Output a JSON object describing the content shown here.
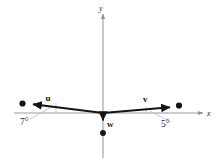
{
  "figure": {
    "background_color": "#ffffff",
    "axis_color": "#9b9b9b",
    "vector_color": "#141414",
    "point_color": "#141414",
    "guide_color": "#b5b5b5"
  },
  "axes": {
    "x_label": "x",
    "y_label": "y",
    "origin": {
      "x": 103,
      "y": 113
    },
    "x_start": {
      "x": 14,
      "y": 113
    },
    "x_end": {
      "x": 203,
      "y": 113
    },
    "y_start": {
      "x": 103,
      "y": 12
    },
    "y_end": {
      "x": 103,
      "y": 158
    }
  },
  "vectors": [
    {
      "name": "u",
      "label": "u",
      "angle_deg": 7,
      "angle_label": "7°",
      "direction": "left-up",
      "tail": {
        "x": 103,
        "y": 113
      },
      "tip": {
        "x": 31,
        "y": 104
      },
      "endpoint_dot": {
        "x": 23,
        "y": 103
      },
      "label_pos": {
        "x": 49,
        "y": 101
      },
      "angle_label_pos": {
        "x": 22,
        "y": 124
      }
    },
    {
      "name": "v",
      "label": "v",
      "angle_deg": 5,
      "angle_label": "5°",
      "direction": "right-up",
      "tail": {
        "x": 103,
        "y": 113
      },
      "tip": {
        "x": 172,
        "y": 107
      },
      "endpoint_dot": {
        "x": 179,
        "y": 105
      },
      "label_pos": {
        "x": 145,
        "y": 102
      },
      "angle_label_pos": {
        "x": 163,
        "y": 126
      }
    },
    {
      "name": "w",
      "label": "w",
      "angle_deg": 90,
      "angle_label": "",
      "direction": "down",
      "tail": {
        "x": 103,
        "y": 113
      },
      "tip": {
        "x": 103,
        "y": 123
      },
      "endpoint_dot": {
        "x": 103,
        "y": 133
      },
      "label_pos": {
        "x": 108,
        "y": 126
      },
      "angle_label_pos": null
    }
  ],
  "guides": [
    {
      "name": "u-angle-guide",
      "from": {
        "x": 30,
        "y": 119
      },
      "to": {
        "x": 52,
        "y": 106
      }
    },
    {
      "name": "u-angle-tick",
      "from": {
        "x": 56,
        "y": 104
      },
      "to": {
        "x": 56,
        "y": 114
      }
    },
    {
      "name": "v-angle-guide",
      "from": {
        "x": 170,
        "y": 121
      },
      "to": {
        "x": 150,
        "y": 110
      }
    },
    {
      "name": "v-angle-tick",
      "from": {
        "x": 146,
        "y": 108
      },
      "to": {
        "x": 146,
        "y": 115
      }
    }
  ]
}
